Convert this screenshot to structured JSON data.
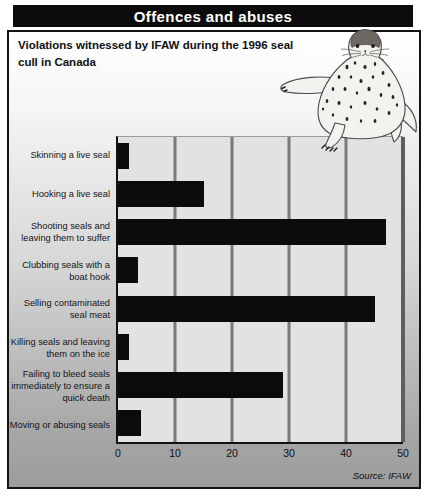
{
  "header": {
    "title": "Offences and abuses"
  },
  "subtitle": "Violations witnessed by IFAW during the 1996 seal cull in Canada",
  "source_credit": "Source: IFAW",
  "icons": {
    "seal_illustration": "spotted-harbour-seal-sitting"
  },
  "colors": {
    "titlebar_bg": "#0c0c0c",
    "titlebar_text": "#ffffff",
    "frame_border": "#141414",
    "bar": "#0b0b0b",
    "plot_bg": "#e2e2e2",
    "gridline": "#7b7b7b"
  },
  "chart_data": {
    "type": "bar",
    "orientation": "horizontal",
    "title": "Violations witnessed by IFAW during the 1996 seal cull in Canada",
    "categories": [
      "Skinning a live seal",
      "Hooking a live seal",
      "Shooting seals and leaving them to suffer",
      "Clubbing seals with a boat hook",
      "Selling contaminated seal meat",
      "Killing seals and leaving them on the ice",
      "Failing to bleed seals immediately to ensure a quick death",
      "Moving or abusing seals"
    ],
    "values": [
      2,
      15,
      47,
      3.5,
      45,
      2,
      29,
      4
    ],
    "xlabel": "",
    "ylabel": "",
    "xlim": [
      0,
      50
    ],
    "x_ticks": [
      0,
      10,
      20,
      30,
      40,
      50
    ],
    "grid": true,
    "legend": "none",
    "source": "Source: IFAW"
  }
}
